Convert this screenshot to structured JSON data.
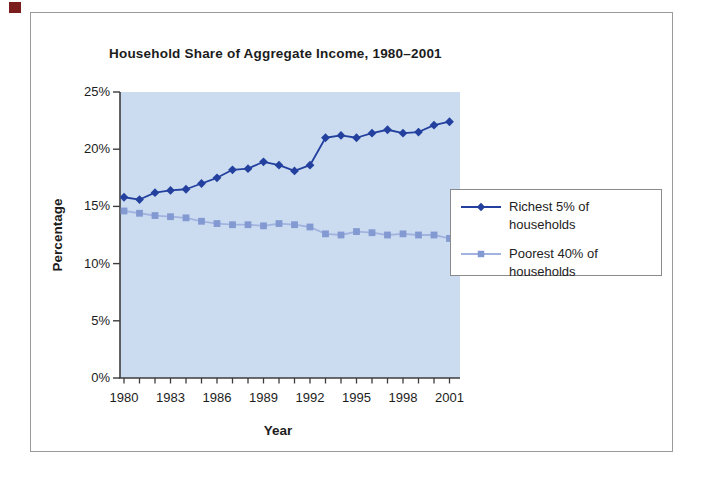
{
  "page": {
    "bullet_color": "#7b1d1d",
    "frame_border_color": "#9a9a9a"
  },
  "chart_data": {
    "type": "line",
    "title": "Household Share of Aggregate Income, 1980–2001",
    "xlabel": "Year",
    "ylabel": "Percentage",
    "x": [
      1980,
      1981,
      1982,
      1983,
      1984,
      1985,
      1986,
      1987,
      1988,
      1989,
      1990,
      1991,
      1992,
      1993,
      1994,
      1995,
      1996,
      1997,
      1998,
      1999,
      2000,
      2001
    ],
    "x_tick_labels": [
      "1980",
      "1983",
      "1986",
      "1989",
      "1992",
      "1995",
      "1998",
      "2001"
    ],
    "x_tick_years": [
      1980,
      1983,
      1986,
      1989,
      1992,
      1995,
      1998,
      2001
    ],
    "y_ticks": [
      0,
      5,
      10,
      15,
      20,
      25
    ],
    "y_tick_labels": [
      "0%",
      "5%",
      "10%",
      "15%",
      "20%",
      "25%"
    ],
    "ylim": [
      0,
      25
    ],
    "grid": false,
    "plot_bg_color": "#cbdcf0",
    "axis_color": "#3c3c3c",
    "legend_position": "right",
    "series": [
      {
        "name": "Richest 5% of households",
        "marker": "diamond",
        "color": "#23409f",
        "line_color": "#23409f",
        "values": [
          15.8,
          15.6,
          16.2,
          16.4,
          16.5,
          17.0,
          17.5,
          18.2,
          18.3,
          18.9,
          18.6,
          18.1,
          18.6,
          21.0,
          21.2,
          21.0,
          21.4,
          21.7,
          21.4,
          21.5,
          22.1,
          22.4
        ]
      },
      {
        "name": "Poorest 40% of households",
        "marker": "square",
        "color": "#8399d2",
        "line_color": "#a2b3e0",
        "values": [
          14.6,
          14.4,
          14.2,
          14.1,
          14.0,
          13.7,
          13.5,
          13.4,
          13.4,
          13.3,
          13.5,
          13.4,
          13.2,
          12.6,
          12.5,
          12.8,
          12.7,
          12.5,
          12.6,
          12.5,
          12.5,
          12.2
        ]
      }
    ]
  }
}
